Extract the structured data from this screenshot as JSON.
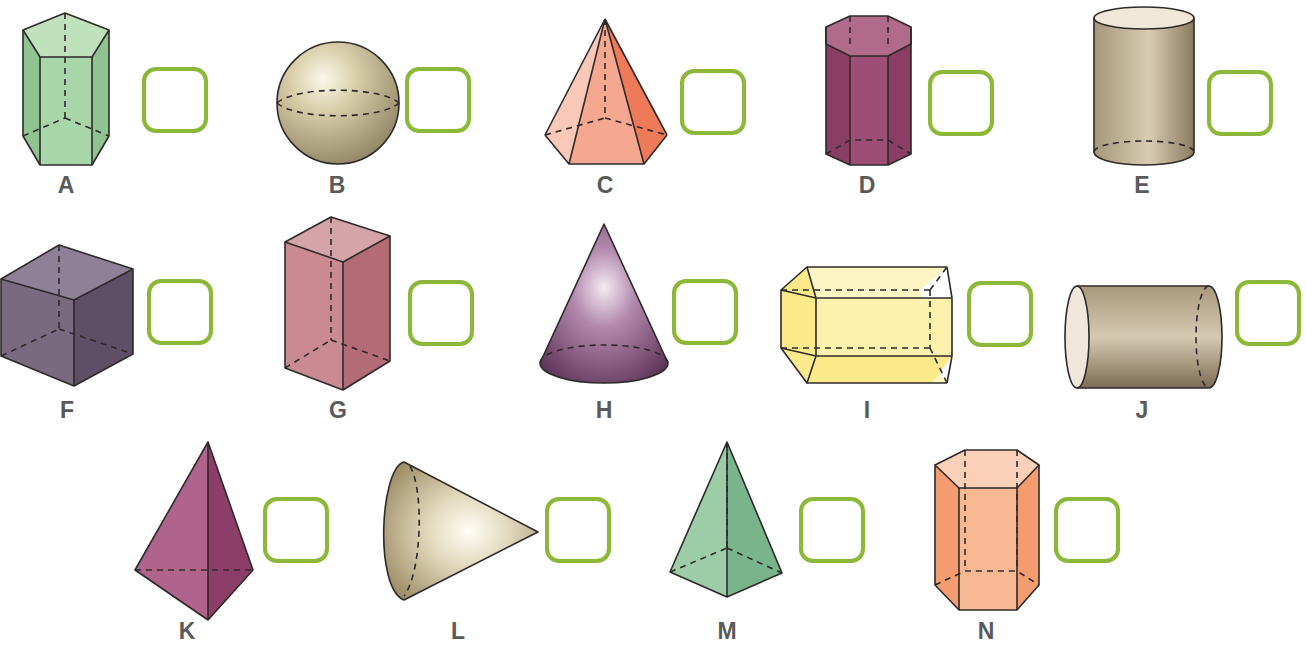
{
  "exercise": {
    "items": [
      {
        "letter": "A",
        "shape": "pentagonal-prism",
        "color": "#a9d6a8",
        "answer": ""
      },
      {
        "letter": "B",
        "shape": "sphere",
        "color": "#c9bd98",
        "answer": ""
      },
      {
        "letter": "C",
        "shape": "hexagonal-pyramid",
        "color": "#f4a78f",
        "answer": ""
      },
      {
        "letter": "D",
        "shape": "hexagonal-prism",
        "color": "#9c4e74",
        "answer": ""
      },
      {
        "letter": "E",
        "shape": "cylinder",
        "color": "#b8a98a",
        "answer": ""
      },
      {
        "letter": "F",
        "shape": "cube",
        "color": "#7a6a80",
        "answer": ""
      },
      {
        "letter": "G",
        "shape": "rectangular-prism",
        "color": "#c98a92",
        "answer": ""
      },
      {
        "letter": "H",
        "shape": "cone",
        "color": "#8c5a86",
        "answer": ""
      },
      {
        "letter": "I",
        "shape": "hexagonal-prism-horizontal",
        "color": "#fbf0a0",
        "answer": ""
      },
      {
        "letter": "J",
        "shape": "cylinder-horizontal",
        "color": "#a89578",
        "answer": ""
      },
      {
        "letter": "K",
        "shape": "triangular-pyramid",
        "color": "#b0648c",
        "answer": ""
      },
      {
        "letter": "L",
        "shape": "cone-horizontal",
        "color": "#c8bb92",
        "answer": ""
      },
      {
        "letter": "M",
        "shape": "square-pyramid",
        "color": "#8cc29a",
        "answer": ""
      },
      {
        "letter": "N",
        "shape": "hexagonal-prism",
        "color": "#f5ab82",
        "answer": ""
      }
    ],
    "answer_box_color": "#8cb83a",
    "label_color": "#5a5a5a"
  }
}
